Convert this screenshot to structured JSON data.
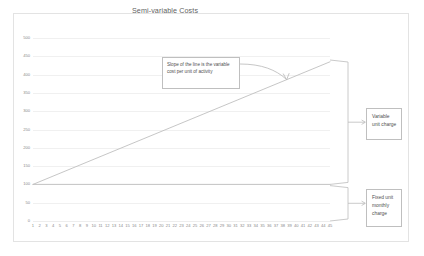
{
  "chart_data": {
    "type": "line",
    "title": "Semi-variable Costs",
    "xlabel": "",
    "ylabel": "",
    "xlim": [
      1,
      45
    ],
    "ylim": [
      0,
      500
    ],
    "grid": true,
    "legend_position": "none",
    "y_ticks": [
      500,
      450,
      400,
      350,
      300,
      250,
      200,
      150,
      100,
      50,
      0
    ],
    "x_ticks": [
      1,
      2,
      3,
      4,
      5,
      6,
      7,
      8,
      9,
      10,
      11,
      12,
      13,
      14,
      15,
      16,
      17,
      18,
      19,
      20,
      21,
      22,
      23,
      24,
      25,
      26,
      27,
      28,
      29,
      30,
      31,
      32,
      33,
      34,
      35,
      36,
      37,
      38,
      39,
      40,
      41,
      42,
      43,
      44,
      45
    ],
    "series": [
      {
        "name": "Total semi-variable cost",
        "x": [
          1,
          45
        ],
        "values": [
          100,
          435
        ]
      },
      {
        "name": "Fixed cost",
        "x": [
          1,
          45
        ],
        "values": [
          100,
          100
        ]
      }
    ],
    "annotations": [
      {
        "name": "slope-callout",
        "text": "Slope of the line is the variable cost per unit of activity",
        "points_to": [
          30,
          393
        ]
      },
      {
        "name": "variable-unit-charge-bracket",
        "text": "Variable unit charge",
        "spans_y": [
          100,
          435
        ]
      },
      {
        "name": "fixed-unit-monthly-charge-bracket",
        "text": "Fixed unit monthly charge",
        "spans_y": [
          0,
          100
        ]
      }
    ],
    "colors": {
      "series_line": "#bfbfbf",
      "gridline": "#f0f0f0",
      "tick_label": "#8a8a8a",
      "title": "#5f5f5f",
      "annotation_border": "#bfbfbf",
      "annotation_text": "#4f4f4f",
      "frame": "#e3e3e3"
    }
  },
  "annotations": {
    "slope_callout": "Slope of the line is the variable cost per unit of activity",
    "variable_unit_charge": "Variable unit charge",
    "fixed_unit_monthly_charge": "Fixed unit monthly charge"
  }
}
